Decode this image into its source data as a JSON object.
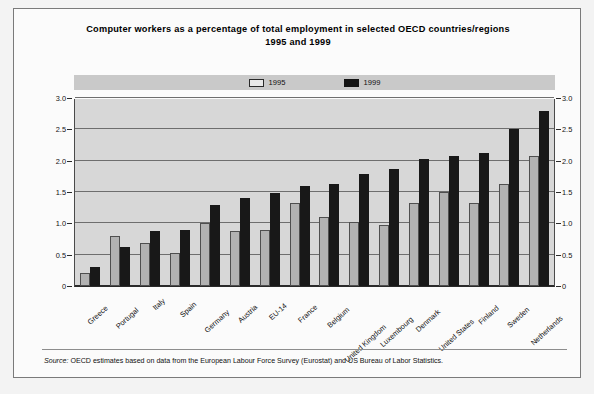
{
  "title": {
    "line1": "Computer workers as a percentage of total employment in selected OECD countries/regions",
    "line2": "1995 and 1999"
  },
  "legend": {
    "items": [
      {
        "label": "1995",
        "color": "#e8e8e8",
        "swatch": "legend-swatch-1995"
      },
      {
        "label": "1999",
        "color": "#141414",
        "swatch": "legend-swatch-1999"
      }
    ]
  },
  "axis": {
    "y_ticks": [
      "0",
      "0.5",
      "1.0",
      "1.5",
      "2.0",
      "2.5",
      "3.0"
    ],
    "y_ticks_right": [
      "0",
      "0.5",
      "1.0",
      "1.5",
      "2.0",
      "2.5",
      "3.0"
    ]
  },
  "source": {
    "keyword": "Source:",
    "text": "OECD estimates based on data from the European Labour Force Survey (Eurostat) and US Bureau of Labor Statistics."
  },
  "colors": {
    "bar_1995": "#b2b2b2",
    "bar_1999": "#181818",
    "plot_background": "#d7d7d7",
    "gridline": "#6e6e6e",
    "frame": "#7a7a7a"
  },
  "chart_data": {
    "type": "bar",
    "title": "Computer workers as a percentage of total employment in selected OECD countries/regions 1995 and 1999",
    "xlabel": "",
    "ylabel": "",
    "ylim": [
      0,
      3.0
    ],
    "yticks": [
      0,
      0.5,
      1.0,
      1.5,
      2.0,
      2.5,
      3.0
    ],
    "grid": true,
    "legend_position": "top-center",
    "categories": [
      "Greece",
      "Portugal",
      "Italy",
      "Spain",
      "Germany",
      "Austria",
      "EU-14",
      "France",
      "Belgium",
      "United Kingdom",
      "Luxembourg",
      "Denmark",
      "United States",
      "Finland",
      "Sweden",
      "Netherlands"
    ],
    "series": [
      {
        "name": "1995",
        "color": "#b2b2b2",
        "values": [
          0.2,
          0.8,
          0.68,
          0.53,
          1.0,
          0.88,
          0.9,
          1.33,
          1.1,
          1.02,
          0.97,
          1.32,
          1.5,
          1.32,
          1.62,
          2.07
        ]
      },
      {
        "name": "1999",
        "color": "#181818",
        "values": [
          0.3,
          0.62,
          0.88,
          0.9,
          1.3,
          1.4,
          1.48,
          1.6,
          1.63,
          1.78,
          1.87,
          2.02,
          2.07,
          2.13,
          2.5,
          2.8
        ]
      }
    ]
  }
}
